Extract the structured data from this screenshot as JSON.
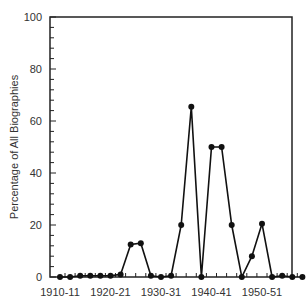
{
  "chart_data": {
    "type": "line",
    "title": "",
    "xlabel": "",
    "ylabel": "Percentage of All Biographies",
    "ylim": [
      0,
      100
    ],
    "yticks": [
      0,
      20,
      40,
      60,
      80,
      100
    ],
    "xtick_labels": [
      "1910-11",
      "1920-21",
      "1930-31",
      "1940-41",
      "1950-51"
    ],
    "grid": false,
    "legend": null,
    "x": [
      "1910-11",
      "1911-12",
      "1912-13",
      "1913-14",
      "1914-15",
      "1915-16",
      "1916-17",
      "1917-18",
      "1918-19",
      "1919-20",
      "1920-21",
      "1921-22",
      "1922-23",
      "1923-24",
      "1924-25",
      "1925-26",
      "1926-27",
      "1927-28",
      "1928-29",
      "1929-30",
      "1930-31",
      "1931-32",
      "1932-33",
      "1933-34",
      "1934-35"
    ],
    "series": [
      {
        "name": "Percentage of All Biographies",
        "values": [
          0,
          0,
          0.5,
          0.5,
          0.5,
          0.5,
          1,
          12.5,
          13,
          0.5,
          0,
          0.5,
          20,
          65.5,
          0,
          50,
          50,
          20,
          0,
          8,
          20.5,
          0,
          0.5,
          0,
          0
        ]
      }
    ]
  },
  "axis": {
    "y_title": "Percentage of All Biographies",
    "y_labels": [
      "0",
      "20",
      "40",
      "60",
      "80",
      "100"
    ],
    "x_labels": [
      "1910-11",
      "1920-21",
      "1930-31",
      "1940-41",
      "1950-51"
    ]
  }
}
